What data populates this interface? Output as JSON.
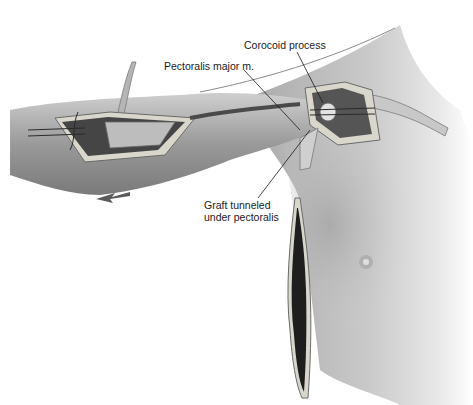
{
  "figure": {
    "type": "surgical-illustration",
    "colors": {
      "skin_light": "#e6e6e6",
      "skin_mid": "#bdbdbd",
      "skin_dark": "#8a8a8a",
      "incision_edge": "#d9d6cc",
      "deep_tissue": "#2a2a2a",
      "leader_line": "#1a1a1a"
    },
    "labels": [
      {
        "id": "corocoid",
        "lines": [
          "Corocoid process"
        ]
      },
      {
        "id": "pectoralis",
        "lines": [
          "Pectoralis major m."
        ]
      },
      {
        "id": "graft",
        "lines": [
          "Graft tunneled",
          "under pectoralis"
        ]
      }
    ]
  }
}
